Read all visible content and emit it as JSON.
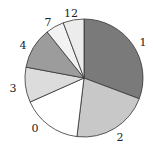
{
  "chart_data": {
    "type": "pie",
    "title": "",
    "start_angle_deg": 0,
    "direction": "clockwise",
    "categories": [
      "1",
      "2",
      "0",
      "3",
      "4",
      "7",
      "12"
    ],
    "values": [
      110.6,
      76.3,
      59.1,
      34.6,
      40.7,
      18.1,
      20.6
    ],
    "value_units": "degrees (estimated share of 360)",
    "percentages": [
      30.7,
      21.2,
      16.4,
      9.6,
      11.3,
      5.0,
      5.7
    ],
    "colors": [
      "#7a7a7a",
      "#c8c8c8",
      "#ffffff",
      "#dcdcdc",
      "#9c9c9c",
      "#f2f2f2",
      "#ececec"
    ],
    "legend": "none (labels placed outside slices)",
    "labels": [
      {
        "text": "1",
        "x": 143,
        "y": 46
      },
      {
        "text": "2",
        "x": 120,
        "y": 141
      },
      {
        "text": "0",
        "x": 35,
        "y": 132
      },
      {
        "text": "3",
        "x": 13,
        "y": 92
      },
      {
        "text": "4",
        "x": 23,
        "y": 49
      },
      {
        "text": "7",
        "x": 48,
        "y": 26
      },
      {
        "text": "12",
        "x": 71,
        "y": 17
      }
    ],
    "geometry": {
      "cx": 84,
      "cy": 78,
      "r": 59
    }
  }
}
